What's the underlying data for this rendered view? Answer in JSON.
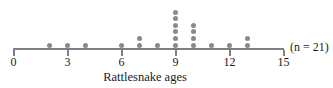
{
  "chart_data": {
    "type": "dotplot",
    "title": "",
    "xlabel": "Rattlesnake ages",
    "ylabel": "",
    "xlim": [
      0,
      15
    ],
    "xticks": [
      0,
      3,
      6,
      9,
      12,
      15
    ],
    "xtick_labels": [
      "0",
      "3",
      "6",
      "9",
      "12",
      "15"
    ],
    "grid": false,
    "legend": null,
    "annotation": "(n = 21)",
    "sample_size": 21,
    "dot_color": "#8a8a8a",
    "axis_color": "#808080",
    "categories": [
      2,
      3,
      4,
      6,
      7,
      8,
      9,
      10,
      11,
      12,
      13
    ],
    "values": [
      1,
      1,
      1,
      1,
      2,
      1,
      6,
      4,
      1,
      1,
      2
    ],
    "data_points": [
      2,
      3,
      4,
      6,
      7,
      7,
      8,
      9,
      9,
      9,
      9,
      9,
      9,
      10,
      10,
      10,
      10,
      11,
      12,
      13,
      13
    ]
  },
  "labels": {
    "x_axis_title": "Rattlesnake ages",
    "n_annotation": "(n = 21)"
  }
}
